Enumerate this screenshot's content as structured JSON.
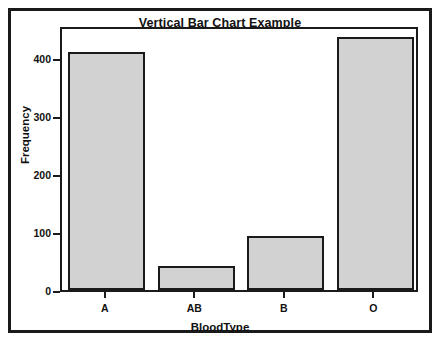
{
  "chart_data": {
    "type": "bar",
    "title": "Vertical Bar Chart Example",
    "xlabel": "BloodType",
    "ylabel": "Frequency",
    "categories": [
      "A",
      "AB",
      "B",
      "O"
    ],
    "values": [
      411,
      41,
      93,
      437
    ],
    "yticks": [
      0,
      100,
      200,
      300,
      400
    ],
    "ytick_labels": [
      "0",
      "100",
      "200",
      "300",
      "400"
    ],
    "ylim": [
      0,
      457
    ],
    "xlim_categories": 4,
    "grid": false,
    "legend": null,
    "bar_fill_color": "#d2d2d2",
    "bar_edge_color": "#1a1a1a",
    "plot_background": "#ffffff",
    "figure_border_color": "#1a1a1a"
  }
}
